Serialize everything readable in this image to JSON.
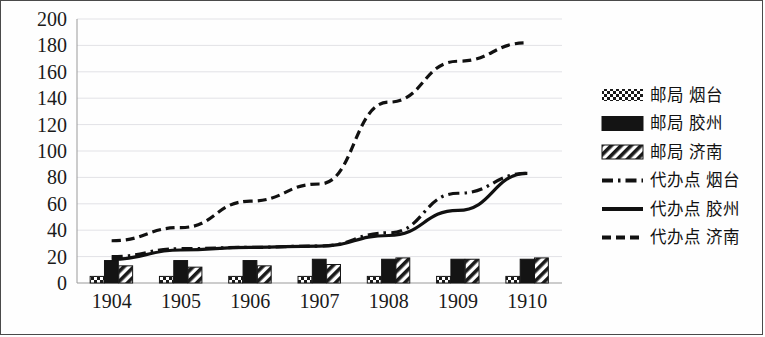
{
  "chart_data": {
    "type": "bar",
    "title": "",
    "subtitle": "",
    "xlabel": "",
    "ylabel": "",
    "categories": [
      "1904",
      "1905",
      "1906",
      "1907",
      "1908",
      "1909",
      "1910"
    ],
    "ylim": [
      0,
      200
    ],
    "y_ticks": [
      "0",
      "20",
      "40",
      "60",
      "80",
      "100",
      "120",
      "140",
      "160",
      "180",
      "200"
    ],
    "y_tick_values": [
      0,
      20,
      40,
      60,
      80,
      100,
      120,
      140,
      160,
      180,
      200
    ],
    "grid": true,
    "legend_position": "right",
    "bar_series": [
      {
        "name": "邮局 烟台",
        "pattern": "dotted",
        "values": [
          5,
          5,
          5,
          5,
          5,
          5,
          5
        ]
      },
      {
        "name": "邮局 胶州",
        "pattern": "solid-black",
        "values": [
          17,
          17,
          17,
          18,
          18,
          18,
          18
        ]
      },
      {
        "name": "邮局 济南",
        "pattern": "diagonal-hatch",
        "values": [
          13,
          12,
          13,
          14,
          19,
          18,
          19
        ]
      }
    ],
    "line_series": [
      {
        "name": "代办点 烟台",
        "pattern": "dash-dot",
        "values": [
          20,
          26,
          27,
          28,
          38,
          68,
          83
        ]
      },
      {
        "name": "代办点 胶州",
        "pattern": "solid",
        "values": [
          18,
          25,
          27,
          28,
          36,
          55,
          83
        ]
      },
      {
        "name": "代办点 济南",
        "pattern": "dashed",
        "values": [
          32,
          42,
          62,
          75,
          137,
          168,
          182
        ]
      }
    ]
  },
  "legend": {
    "items": [
      {
        "label": "邮局 烟台",
        "marker": "dotted-bar-swatch"
      },
      {
        "label": "邮局 胶州",
        "marker": "solid-black-bar-swatch"
      },
      {
        "label": "邮局 济南",
        "marker": "hatched-bar-swatch"
      },
      {
        "label": "代办点 烟台",
        "marker": "dash-dot-line-swatch"
      },
      {
        "label": "代办点 胶州",
        "marker": "solid-line-swatch"
      },
      {
        "label": "代办点 济南",
        "marker": "dashed-line-swatch"
      }
    ]
  },
  "colors": {
    "ink": "#111111",
    "grid": "#e2e2e6",
    "border": "#4a4a4a",
    "background": "#ffffff"
  }
}
